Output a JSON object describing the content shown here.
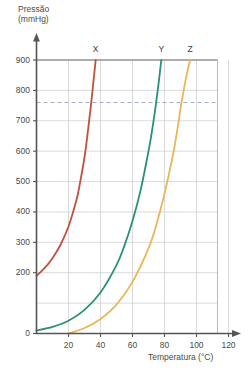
{
  "chart_data": {
    "type": "line",
    "title": "",
    "xlabel": "Temperatura (°C)",
    "ylabel": "Pressão (mmHg)",
    "ylabel_line1": "Pressão",
    "ylabel_line2": "(mmHg)",
    "xlim": [
      0,
      130
    ],
    "ylim": [
      0,
      900
    ],
    "xticks": [
      20,
      40,
      60,
      80,
      100,
      120
    ],
    "xtick_labels": [
      "20",
      "40",
      "60",
      "80",
      "100",
      "120"
    ],
    "yticks": [
      0,
      200,
      300,
      400,
      500,
      600,
      700,
      800,
      900
    ],
    "ytick_labels": [
      "0",
      "200",
      "300",
      "400",
      "500",
      "600",
      "700",
      "800",
      "900"
    ],
    "grid": true,
    "legend": "inline-curve-labels",
    "annotations": [
      {
        "name": "atmospheric-pressure-line",
        "type": "horizontal-dashed",
        "value": 760,
        "label": ""
      }
    ],
    "series": [
      {
        "name": "X",
        "label": "X",
        "color": "#c1503c",
        "boiling_point_760": 30,
        "points": [
          [
            0,
            190
          ],
          [
            5,
            215
          ],
          [
            10,
            248
          ],
          [
            15,
            292
          ],
          [
            20,
            352
          ],
          [
            25,
            440
          ],
          [
            27,
            490
          ],
          [
            30,
            580
          ],
          [
            32,
            660
          ],
          [
            34,
            750
          ],
          [
            36,
            850
          ],
          [
            37,
            900
          ]
        ]
      },
      {
        "name": "Y",
        "label": "Y",
        "color": "#2a8f7b",
        "boiling_point_760": 72,
        "points": [
          [
            0,
            10
          ],
          [
            10,
            22
          ],
          [
            20,
            42
          ],
          [
            30,
            78
          ],
          [
            40,
            135
          ],
          [
            50,
            225
          ],
          [
            55,
            290
          ],
          [
            60,
            370
          ],
          [
            65,
            470
          ],
          [
            70,
            600
          ],
          [
            72,
            660
          ],
          [
            74,
            730
          ],
          [
            76,
            810
          ],
          [
            78,
            900
          ]
        ]
      },
      {
        "name": "Z",
        "label": "Z",
        "color": "#e8b75a",
        "boiling_point_760": 90,
        "points": [
          [
            20,
            0
          ],
          [
            30,
            18
          ],
          [
            40,
            48
          ],
          [
            50,
            95
          ],
          [
            60,
            170
          ],
          [
            70,
            280
          ],
          [
            75,
            360
          ],
          [
            80,
            460
          ],
          [
            85,
            580
          ],
          [
            88,
            670
          ],
          [
            90,
            740
          ],
          [
            92,
            800
          ],
          [
            94,
            855
          ],
          [
            96,
            900
          ]
        ]
      }
    ]
  },
  "curve_labels": [
    {
      "text": "X",
      "x_value": 37
    },
    {
      "text": "Y",
      "x_value": 78
    },
    {
      "text": "Z",
      "x_value": 96
    }
  ]
}
